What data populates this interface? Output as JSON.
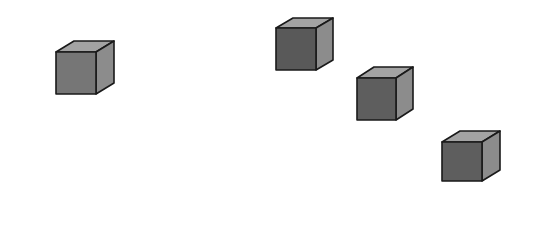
{
  "scene": {
    "background": "#ffffff",
    "width": 543,
    "height": 235,
    "cube_count": 4,
    "colors": {
      "front": "#6e6e6e",
      "top": "#a3a3a3",
      "side": "#8c8c8c",
      "outline": "#1a1a1a"
    },
    "cubes": [
      {
        "id": "cube-1",
        "front": [
          56,
          52,
          40,
          42
        ],
        "depth_x": 18,
        "depth_y": -11,
        "front_color": "#767676"
      },
      {
        "id": "cube-2",
        "front": [
          276,
          28,
          40,
          42
        ],
        "depth_x": 17,
        "depth_y": -10,
        "front_color": "#595959"
      },
      {
        "id": "cube-3",
        "front": [
          357,
          78,
          39,
          42
        ],
        "depth_x": 17,
        "depth_y": -11,
        "front_color": "#5e5e5e"
      },
      {
        "id": "cube-4",
        "front": [
          442,
          142,
          40,
          39
        ],
        "depth_x": 18,
        "depth_y": -11,
        "front_color": "#5e5e5e"
      }
    ]
  }
}
